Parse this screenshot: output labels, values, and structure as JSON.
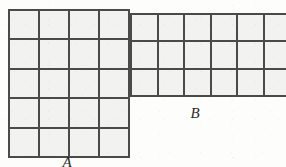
{
  "figure": {
    "type": "geometry-grid-diagram",
    "background_color": "#fdfdfc",
    "grid_line_color": "#4a4a4a",
    "cell_fill_color": "#f2f2f0",
    "shapes": [
      {
        "id": "A",
        "label": "A",
        "columns": 4,
        "rows": 5,
        "total_cells": 20,
        "label_position": "below",
        "clipped": false
      },
      {
        "id": "B",
        "label": "B",
        "columns": 6,
        "rows": 3,
        "total_cells": 18,
        "label_position": "below",
        "clipped": true,
        "clipped_edge": "right"
      }
    ]
  }
}
